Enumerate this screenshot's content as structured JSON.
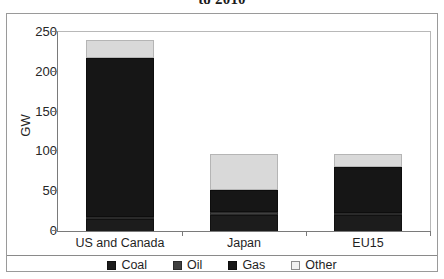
{
  "chart_data": {
    "type": "bar",
    "subtype": "stacked-column",
    "title": "to 2010",
    "title_note": "title clipped at top edge of screenshot",
    "xlabel": "",
    "ylabel": "GW",
    "categories": [
      "US and Canada",
      "Japan",
      "EU15"
    ],
    "ylim": [
      0,
      250
    ],
    "yticks": [
      0,
      50,
      100,
      150,
      200,
      250
    ],
    "grid": false,
    "legend_position": "bottom",
    "series": [
      {
        "name": "Coal",
        "color": "#1c1c1c",
        "values": [
          15,
          20,
          20
        ]
      },
      {
        "name": "Oil",
        "color": "#3f3f3f",
        "values": [
          3,
          4,
          3
        ]
      },
      {
        "name": "Gas",
        "color": "#161616",
        "values": [
          200,
          27,
          58
        ]
      },
      {
        "name": "Other",
        "color": "#d9d9d9",
        "values": [
          22,
          46,
          16
        ]
      }
    ],
    "totals": [
      240,
      97,
      97
    ]
  },
  "axis": {
    "y_label": "GW",
    "y_ticks": [
      "250",
      "200",
      "150",
      "100",
      "50",
      "0"
    ],
    "x_categories": [
      "US and Canada",
      "Japan",
      "EU15"
    ]
  },
  "legend": {
    "items": [
      {
        "label": "Coal",
        "swatch": "swatch-coal"
      },
      {
        "label": "Oil",
        "swatch": "swatch-oil"
      },
      {
        "label": "Gas",
        "swatch": "swatch-gas"
      },
      {
        "label": "Other",
        "swatch": "swatch-other"
      }
    ]
  }
}
